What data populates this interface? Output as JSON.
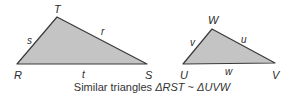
{
  "figure": {
    "colors": {
      "fill": "#c4c4c4",
      "stroke": "#3a3a3a",
      "text": "#2a2a2a"
    },
    "triangle1": {
      "vertices": {
        "R": "R",
        "S": "S",
        "T": "T"
      },
      "sides": {
        "s": "s",
        "r": "r",
        "t": "t"
      }
    },
    "triangle2": {
      "vertices": {
        "U": "U",
        "V": "V",
        "W": "W"
      },
      "sides": {
        "v": "v",
        "u": "u",
        "w": "w"
      }
    },
    "caption": {
      "prefix": "Similar triangles ",
      "tri1": "ΔRST",
      "relation": " ~ ",
      "tri2": "ΔUVW"
    }
  }
}
